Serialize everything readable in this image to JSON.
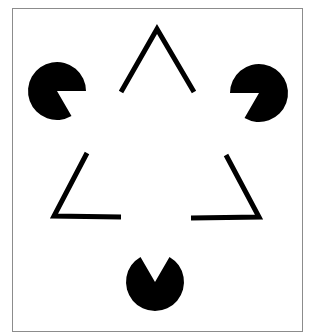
{
  "figure": {
    "colors": {
      "background": "#ffffff",
      "frame": "#8c8c8c",
      "shapes": "#000000"
    },
    "elements": {
      "inducers": [
        {
          "name": "pacman-top-left",
          "notch_direction": "down-right"
        },
        {
          "name": "pacman-top-right",
          "notch_direction": "down-left"
        },
        {
          "name": "pacman-bottom",
          "notch_direction": "up"
        }
      ],
      "outline_corners": [
        {
          "name": "corner-top",
          "orientation": "apex-up"
        },
        {
          "name": "corner-bottom-left",
          "orientation": "lower-left"
        },
        {
          "name": "corner-bottom-right",
          "orientation": "lower-right"
        }
      ]
    }
  }
}
